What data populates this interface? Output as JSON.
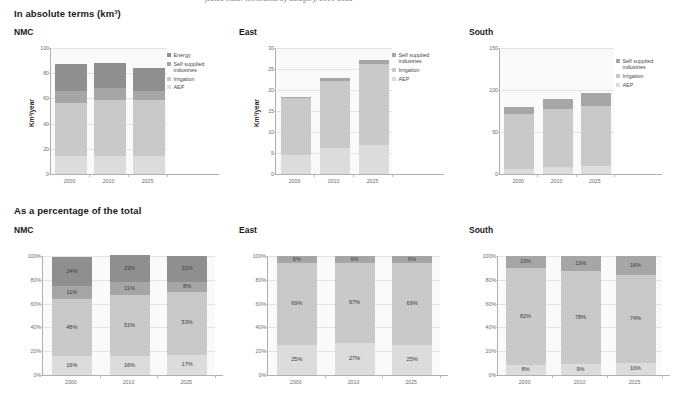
{
  "colors": {
    "energy": "#8f8f8f",
    "self_supplied_industries": "#a6a6a6",
    "irrigation": "#c9c9c9",
    "aep": "#dcdcdc",
    "plot_bg": "#fafafa",
    "grid": "#e3e3e3",
    "axis": "#b0b0b0",
    "tick_text": "#6d6d6d",
    "title_text": "#1a1a1a"
  },
  "top_strip": {
    "text": "jected water withdrawal by category, 2000-2025"
  },
  "sections": [
    {
      "id": "absolute",
      "title": "In absolute terms (km³)"
    },
    {
      "id": "percentage",
      "title": "As a percentage of the total"
    }
  ],
  "legend_labels": {
    "energy": "Energy",
    "self_supplied_industries": "Self supplied industries",
    "irrigation": "Irrigation",
    "aep": "AEP"
  },
  "chart_data": [
    {
      "id": "nmc-absolute",
      "type": "bar",
      "stacked": true,
      "title": "NMC",
      "section": "In absolute terms (km³)",
      "xlabel": "",
      "ylabel": "Km³/year",
      "ylim": [
        0,
        100
      ],
      "yticks": [
        0,
        20,
        40,
        60,
        80,
        100
      ],
      "ytick_labels": [
        "0",
        "20",
        "40",
        "60",
        "80",
        "100"
      ],
      "categories": [
        "2000",
        "2010",
        "2025"
      ],
      "grid": true,
      "legend_position": "right",
      "legend": [
        "Energy",
        "Self supplied industries",
        "Irrigation",
        "AEP"
      ],
      "series": [
        {
          "name": "AEP",
          "values": [
            14,
            14,
            14.5
          ]
        },
        {
          "name": "Irrigation",
          "values": [
            42,
            44.5,
            44.5
          ]
        },
        {
          "name": "Self supplied industries",
          "values": [
            9.5,
            9.5,
            6.8
          ]
        },
        {
          "name": "Energy",
          "values": [
            22,
            20,
            18.5
          ]
        }
      ],
      "totals": [
        87.5,
        88,
        84.3
      ]
    },
    {
      "id": "east-absolute",
      "type": "bar",
      "stacked": true,
      "title": "East",
      "section": "In absolute terms (km³)",
      "xlabel": "",
      "ylabel": "Km³/year",
      "ylim": [
        0,
        30
      ],
      "yticks": [
        0,
        5,
        10,
        15,
        20,
        25,
        30
      ],
      "ytick_labels": [
        "0",
        "5",
        "10",
        "15",
        "20",
        "25",
        "30"
      ],
      "categories": [
        "2000",
        "2010",
        "2025"
      ],
      "grid": true,
      "legend_position": "right",
      "legend": [
        "Self supplied industries",
        "Irrigation",
        "AEP"
      ],
      "series": [
        {
          "name": "AEP",
          "values": [
            4.6,
            6.2,
            6.8
          ]
        },
        {
          "name": "Irrigation",
          "values": [
            13.4,
            16.0,
            19.5
          ]
        },
        {
          "name": "Self supplied industries",
          "values": [
            0.4,
            0.6,
            0.9
          ]
        }
      ],
      "totals": [
        18.4,
        22.8,
        27.2
      ]
    },
    {
      "id": "south-absolute",
      "type": "bar",
      "stacked": true,
      "title": "South",
      "section": "In absolute terms (km³)",
      "xlabel": "",
      "ylabel": "",
      "ylim": [
        0,
        150
      ],
      "yticks": [
        0,
        50,
        100,
        150
      ],
      "ytick_labels": [
        "0",
        "50",
        "100",
        "150"
      ],
      "categories": [
        "2000",
        "2010",
        "2025"
      ],
      "grid": true,
      "legend_position": "right",
      "legend": [
        "Self supplied industries",
        "Irrigation",
        "AEP"
      ],
      "series": [
        {
          "name": "AEP",
          "values": [
            6.4,
            8.0,
            9.7
          ]
        },
        {
          "name": "Irrigation",
          "values": [
            65.6,
            69.2,
            71.8
          ]
        },
        {
          "name": "Self supplied industries",
          "values": [
            8.0,
            11.6,
            15.5
          ]
        }
      ],
      "totals": [
        80,
        88.8,
        97
      ]
    },
    {
      "id": "nmc-percentage",
      "type": "bar",
      "stacked": true,
      "normalized": true,
      "title": "NMC",
      "section": "As a percentage of the total",
      "xlabel": "",
      "ylabel": "",
      "ylim": [
        0,
        100
      ],
      "yticks": [
        0,
        20,
        40,
        60,
        80,
        100
      ],
      "ytick_labels": [
        "0%",
        "20%",
        "40%",
        "60%",
        "80%",
        "100%"
      ],
      "categories": [
        "2000",
        "2010",
        "2025"
      ],
      "grid": true,
      "legend_position": "none",
      "series": [
        {
          "name": "AEP",
          "values": [
            16,
            16,
            17
          ],
          "labels": [
            "16%",
            "16%",
            "17%"
          ]
        },
        {
          "name": "Irrigation",
          "values": [
            48,
            51,
            53
          ],
          "labels": [
            "48%",
            "51%",
            "53%"
          ]
        },
        {
          "name": "Self supplied industries",
          "values": [
            11,
            11,
            8
          ],
          "labels": [
            "11%",
            "11%",
            "8%"
          ]
        },
        {
          "name": "Energy",
          "values": [
            24,
            23,
            22
          ],
          "labels": [
            "24%",
            "23%",
            "22%"
          ]
        }
      ]
    },
    {
      "id": "east-percentage",
      "type": "bar",
      "stacked": true,
      "normalized": true,
      "title": "East",
      "section": "As a percentage of the total",
      "xlabel": "",
      "ylabel": "",
      "ylim": [
        0,
        100
      ],
      "yticks": [
        0,
        20,
        40,
        60,
        80,
        100
      ],
      "ytick_labels": [
        "0%",
        "20%",
        "40%",
        "60%",
        "80%",
        "100%"
      ],
      "categories": [
        "2000",
        "2010",
        "2025"
      ],
      "grid": true,
      "legend_position": "none",
      "series": [
        {
          "name": "AEP",
          "values": [
            25,
            27,
            25
          ],
          "labels": [
            "25%",
            "27%",
            "25%"
          ]
        },
        {
          "name": "Irrigation",
          "values": [
            69,
            67,
            69
          ],
          "labels": [
            "69%",
            "67%",
            "69%"
          ]
        },
        {
          "name": "Self supplied industries",
          "values": [
            6,
            6,
            6
          ],
          "labels": [
            "6%",
            "6%",
            "6%"
          ]
        }
      ]
    },
    {
      "id": "south-percentage",
      "type": "bar",
      "stacked": true,
      "normalized": true,
      "title": "South",
      "section": "As a percentage of the total",
      "xlabel": "",
      "ylabel": "",
      "ylim": [
        0,
        100
      ],
      "yticks": [
        0,
        20,
        40,
        60,
        80,
        100
      ],
      "ytick_labels": [
        "0%",
        "20%",
        "40%",
        "60%",
        "80%",
        "100%"
      ],
      "categories": [
        "2000",
        "2010",
        "2025"
      ],
      "grid": true,
      "legend_position": "none",
      "series": [
        {
          "name": "AEP",
          "values": [
            8,
            9,
            10
          ],
          "labels": [
            "8%",
            "9%",
            "10%"
          ]
        },
        {
          "name": "Irrigation",
          "values": [
            82,
            78,
            74
          ],
          "labels": [
            "82%",
            "78%",
            "74%"
          ]
        },
        {
          "name": "Self supplied industries",
          "values": [
            10,
            13,
            16
          ],
          "labels": [
            "10%",
            "13%",
            "16%"
          ]
        }
      ]
    }
  ]
}
